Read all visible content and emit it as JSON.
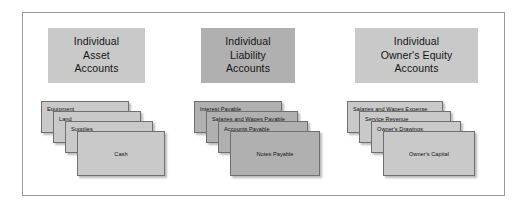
{
  "figure": {
    "colors": {
      "light_gray": "#c9c9c9",
      "dark_gray": "#b0b0b0",
      "card_border": "#6f6f6f",
      "frame_border": "#9a9a9a",
      "background": "#ffffff",
      "text": "#101010"
    }
  },
  "columns": [
    {
      "id": "assets",
      "header": {
        "lines": [
          "Individual",
          "Asset",
          "Accounts"
        ],
        "fill": "#c9c9c9"
      },
      "cards": [
        {
          "label": "Equipment",
          "fill": "#c9c9c9"
        },
        {
          "label": "Land",
          "fill": "#c9c9c9"
        },
        {
          "label": "Supplies",
          "fill": "#c9c9c9"
        },
        {
          "label": "Cash",
          "fill": "#c9c9c9"
        }
      ]
    },
    {
      "id": "liabilities",
      "header": {
        "lines": [
          "Individual",
          "Liability",
          "Accounts"
        ],
        "fill": "#b0b0b0"
      },
      "cards": [
        {
          "label": "Interest Payable",
          "fill": "#b0b0b0"
        },
        {
          "label": "Salaries and Wages Payable",
          "fill": "#b0b0b0"
        },
        {
          "label": "Accounts Payable",
          "fill": "#b0b0b0"
        },
        {
          "label": "Notes Payable",
          "fill": "#b0b0b0"
        }
      ]
    },
    {
      "id": "owners-equity",
      "header": {
        "lines": [
          "Individual",
          "Owner's Equity",
          "Accounts"
        ],
        "fill": "#c9c9c9"
      },
      "cards": [
        {
          "label": "Salaries and Wages Expense",
          "fill": "#c9c9c9"
        },
        {
          "label": "Service Revenue",
          "fill": "#c9c9c9"
        },
        {
          "label": "Owner's Drawings",
          "fill": "#c9c9c9"
        },
        {
          "label": "Owner's Capital",
          "fill": "#c9c9c9"
        }
      ]
    }
  ]
}
